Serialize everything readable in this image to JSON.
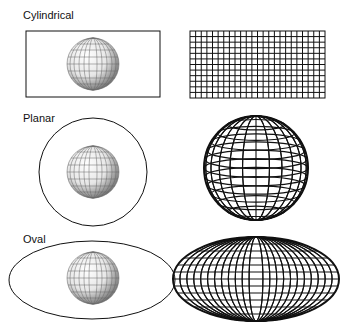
{
  "rows": [
    {
      "label": "Cylindrical",
      "surface": "rectangle",
      "result": "rectangular grid"
    },
    {
      "label": "Planar",
      "surface": "circle",
      "result": "azimuthal globe"
    },
    {
      "label": "Oval",
      "surface": "ellipse",
      "result": "oval graticule"
    }
  ],
  "colors": {
    "line": "#111111",
    "background": "#ffffff"
  }
}
